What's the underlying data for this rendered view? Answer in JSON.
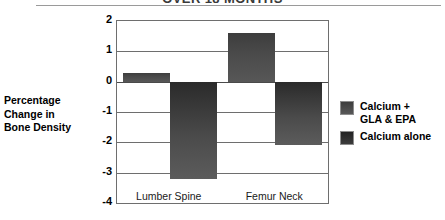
{
  "chart_data": {
    "type": "bar",
    "title": "OVER 18 MONTHS",
    "xlabel": "",
    "ylabel": "Percentage Change in Bone Density",
    "ylabel_lines": [
      "Percentage",
      "Change in",
      "Bone Density"
    ],
    "categories": [
      "Lumber Spine",
      "Femur Neck"
    ],
    "series": [
      {
        "name": "Calcium + GLA & EPA",
        "values": [
          0.3,
          1.6
        ],
        "color": "#4b4b4b"
      },
      {
        "name": "Calcium alone",
        "values": [
          -3.2,
          -2.1
        ],
        "color": "#333333"
      }
    ],
    "ylim": [
      -4,
      2
    ],
    "yticks": [
      2,
      1,
      0,
      -1,
      -2,
      -3,
      -4
    ],
    "ytick_labels": [
      "2",
      "1",
      "0",
      "-1",
      "-2",
      "-3",
      "-4"
    ],
    "grid": true,
    "legend_position": "right",
    "legend_entries": [
      {
        "label_lines": [
          "Calcium +",
          "GLA & EPA"
        ]
      },
      {
        "label_lines": [
          "Calcium alone"
        ]
      }
    ]
  }
}
